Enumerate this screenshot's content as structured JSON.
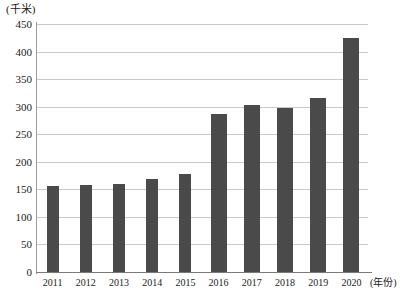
{
  "chart_data": {
    "type": "bar",
    "title": "",
    "subtitle": "",
    "xlabel": "(年份)",
    "ylabel": "(千米)",
    "categories": [
      "2011",
      "2012",
      "2013",
      "2014",
      "2015",
      "2016",
      "2017",
      "2018",
      "2019",
      "2020"
    ],
    "values": [
      156,
      158,
      160,
      168,
      178,
      286,
      303,
      298,
      316,
      424
    ],
    "ylim": [
      0,
      450
    ],
    "y_ticks": [
      "0",
      "50",
      "100",
      "150",
      "200",
      "250",
      "300",
      "350",
      "400",
      "450"
    ],
    "y_tick_values": [
      0,
      50,
      100,
      150,
      200,
      250,
      300,
      350,
      400,
      450
    ],
    "grid": "horizontal",
    "legend": "none",
    "bar_color": "#4a4a4a",
    "grid_color": "#c9c9c9",
    "axis_color": "#7a7a7a",
    "series": [
      {
        "name": "",
        "values": [
          156,
          158,
          160,
          168,
          178,
          286,
          303,
          298,
          316,
          424
        ]
      }
    ]
  },
  "axes": {
    "y_unit_label": "(千米)",
    "x_unit_label": "(年份)"
  }
}
